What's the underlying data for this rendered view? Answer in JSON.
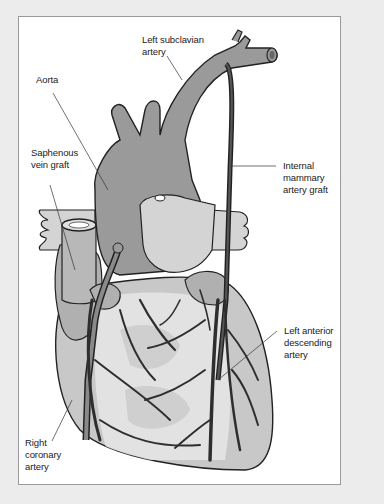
{
  "figure": {
    "colors": {
      "background": "#ececec",
      "frame_fill": "#ffffff",
      "frame_border": "#9a9a9a",
      "aorta_gray": "#9a9a9a",
      "heart_gray": "#c8c8c8",
      "vessel_dark": "#3a3a3a",
      "label_text": "#222222"
    },
    "labels": {
      "left_subclavian": "Left subclavian\nartery",
      "aorta": "Aorta",
      "saphenous": "Saphenous\nvein graft",
      "internal_mammary": "Internal\nmammary\nartery graft",
      "lad": "Left anterior\ndescending\nartery",
      "right_coronary": "Right\ncoronary\nartery"
    }
  }
}
